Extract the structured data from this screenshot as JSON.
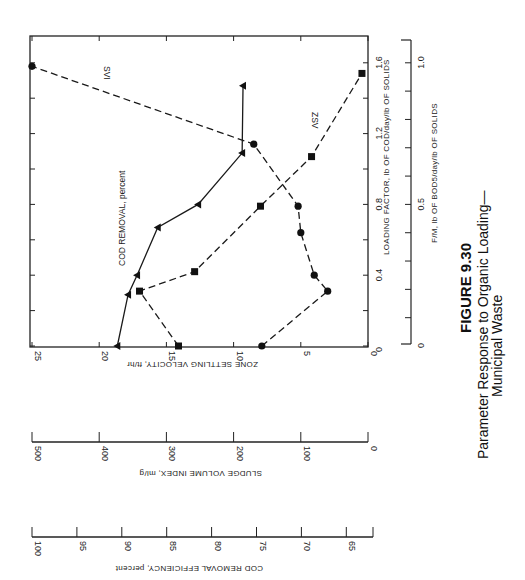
{
  "caption": {
    "figure_number": "FIGURE 9.30",
    "line1": "Parameter Response to Organic Loading—",
    "line2": "Municipal Waste"
  },
  "chart_data": {
    "type": "line",
    "figure": "FIGURE 9.30",
    "orientation": "page rotated 90°; independent variable runs vertically",
    "x_axis": {
      "label": "LOADING FACTOR, lb OF COD/day/lb OF SOLIDS",
      "range": [
        0,
        1.75
      ],
      "ticks": [
        0,
        0.4,
        0.8,
        1.2,
        1.6
      ],
      "minor_step": 0.2
    },
    "x2_axis": {
      "label": "F/M, lb OF BOD5/day/lb OF SOLIDS",
      "ticks": [
        0,
        0.5,
        1.0
      ],
      "minor_step": 0.1,
      "note": "F/M 1.0 aligns with loading factor 1.6"
    },
    "y_axes": [
      {
        "id": "zsv",
        "label": "ZONE SETTLING VELOCITY, ft/hr",
        "ticks": [
          25,
          20,
          15,
          10,
          5,
          0
        ],
        "range": [
          0,
          25
        ]
      },
      {
        "id": "svi",
        "label": "SLUDGE VOLUME INDEX, ml/g",
        "ticks": [
          500,
          400,
          300,
          200,
          100,
          0
        ],
        "range": [
          0,
          500
        ]
      },
      {
        "id": "cod",
        "label": "COD REMOVAL EFFICIENCY, percent",
        "ticks": [
          100,
          95,
          90,
          85,
          80,
          75,
          70,
          65
        ],
        "range": [
          62.5,
          100
        ]
      }
    ],
    "series": [
      {
        "name": "COD REMOVAL, percent",
        "axis": "cod",
        "marker": "triangle",
        "line": "solid",
        "points": [
          {
            "x": 0.0,
            "y": 90.5
          },
          {
            "x": 0.29,
            "y": 89.3
          },
          {
            "x": 0.4,
            "y": 88.3
          },
          {
            "x": 0.67,
            "y": 86.0
          },
          {
            "x": 0.8,
            "y": 81.5
          },
          {
            "x": 1.09,
            "y": 76.6
          },
          {
            "x": 1.47,
            "y": 76.5
          }
        ]
      },
      {
        "name": "ZSV",
        "axis": "zsv",
        "marker": "square",
        "line": "dashed",
        "points": [
          {
            "x": 0.0,
            "y": 14.1
          },
          {
            "x": 0.31,
            "y": 17.0
          },
          {
            "x": 0.42,
            "y": 12.9
          },
          {
            "x": 0.79,
            "y": 8.0
          },
          {
            "x": 1.07,
            "y": 4.2
          },
          {
            "x": 1.54,
            "y": 0.45
          }
        ]
      },
      {
        "name": "SVI",
        "axis": "svi",
        "marker": "circle",
        "line": "dashed",
        "points": [
          {
            "x": 0.0,
            "y": 158
          },
          {
            "x": 0.31,
            "y": 60
          },
          {
            "x": 0.4,
            "y": 80
          },
          {
            "x": 0.64,
            "y": 100
          },
          {
            "x": 0.79,
            "y": 104
          },
          {
            "x": 1.14,
            "y": 170
          },
          {
            "x": 1.58,
            "y": 500
          }
        ]
      }
    ],
    "annotations": [
      {
        "text": "SVI",
        "near_series": "SVI"
      },
      {
        "text": "ZSV",
        "near_series": "ZSV"
      },
      {
        "text": "COD REMOVAL, percent",
        "near_series": "COD REMOVAL, percent"
      }
    ],
    "grid": false,
    "legend": "none (series labeled inline)"
  }
}
